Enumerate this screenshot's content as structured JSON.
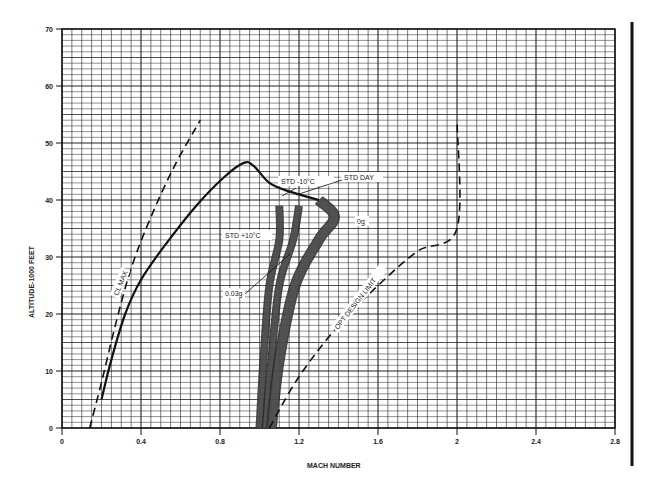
{
  "chart_data": {
    "type": "line",
    "title": "",
    "xlabel": "MACH NUMBER",
    "ylabel": "ALTITUDE-1000 FEET",
    "xlim": [
      0,
      2.8
    ],
    "ylim": [
      0,
      70
    ],
    "x_ticks": [
      "0",
      "0.4",
      "0.8",
      "1.2",
      "1.6",
      "2",
      "2.4",
      "2.8"
    ],
    "y_ticks": [
      "0",
      "10",
      "20",
      "30",
      "40",
      "50",
      "60",
      "70"
    ],
    "grid": true,
    "series": [
      {
        "name": "CL MAX",
        "style": "dashed",
        "points": [
          [
            0.14,
            0
          ],
          [
            0.2,
            8
          ],
          [
            0.27,
            18
          ],
          [
            0.35,
            28
          ],
          [
            0.45,
            37
          ],
          [
            0.57,
            46
          ],
          [
            0.7,
            54
          ]
        ]
      },
      {
        "name": "Flight envelope boundary",
        "style": "solid",
        "points": [
          [
            0.2,
            5
          ],
          [
            0.25,
            12
          ],
          [
            0.32,
            20
          ],
          [
            0.4,
            26
          ],
          [
            0.52,
            32
          ],
          [
            0.68,
            39
          ],
          [
            0.82,
            44
          ],
          [
            0.92,
            46.5
          ],
          [
            0.97,
            46
          ],
          [
            1.05,
            43
          ],
          [
            1.15,
            41.5
          ],
          [
            1.3,
            40
          ]
        ]
      },
      {
        "name": "STD +10°C",
        "style": "shaded band",
        "points": [
          [
            1.0,
            0
          ],
          [
            1.02,
            12
          ],
          [
            1.05,
            25
          ],
          [
            1.1,
            33
          ],
          [
            1.1,
            39
          ]
        ]
      },
      {
        "name": "STD DAY",
        "style": "shaded band",
        "points": [
          [
            1.03,
            0
          ],
          [
            1.06,
            12
          ],
          [
            1.1,
            25
          ],
          [
            1.17,
            33
          ],
          [
            1.2,
            39
          ]
        ]
      },
      {
        "name": "STD -10°C",
        "style": "shaded band",
        "points": [
          [
            1.06,
            0
          ],
          [
            1.1,
            12
          ],
          [
            1.18,
            25
          ],
          [
            1.3,
            33
          ],
          [
            1.38,
            37
          ],
          [
            1.3,
            40
          ]
        ]
      },
      {
        "name": "OPT DESIGN LIMIT",
        "style": "dashed",
        "points": [
          [
            1.05,
            0
          ],
          [
            1.2,
            9
          ],
          [
            1.4,
            18
          ],
          [
            1.6,
            25
          ],
          [
            1.8,
            31
          ],
          [
            2.0,
            35
          ],
          [
            2.0,
            54
          ]
        ]
      }
    ],
    "annotations": [
      "STD -10°C",
      "STD DAY",
      "STD +10°C",
      "0g",
      "0.03g",
      "CL MAX",
      "OPT DESIGN LIMIT"
    ]
  },
  "labels": {
    "xlabel": "MACH NUMBER",
    "ylabel": "ALTITUDE-1000 FEET",
    "std_minus": "STD -10°C",
    "std_day": "STD DAY",
    "std_plus": "STD +10°C",
    "zero_g": "0g",
    "g003": "0.03g",
    "cl_max": "CL MAX",
    "opt_limit": "OPT DESIGN LIMIT"
  },
  "ticks": {
    "x": [
      "0",
      "0.4",
      "0.8",
      "1.2",
      "1.6",
      "2",
      "2.4",
      "2.8"
    ],
    "y": [
      "0",
      "10",
      "20",
      "30",
      "40",
      "50",
      "60",
      "70"
    ]
  }
}
